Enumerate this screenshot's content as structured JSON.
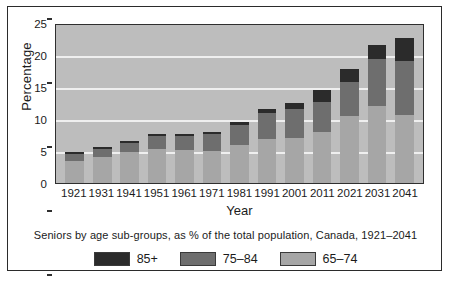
{
  "chart_data": {
    "type": "bar",
    "stacked": true,
    "title": "",
    "caption": "Seniors by age sub-groups, as % of the total population, Canada, 1921–2041",
    "xlabel": "Year",
    "ylabel": "Percentage",
    "ylim": [
      0,
      25
    ],
    "yticks": [
      0,
      5,
      10,
      15,
      20,
      25
    ],
    "grid": true,
    "legend_position": "bottom",
    "categories": [
      "1921",
      "1931",
      "1941",
      "1951",
      "1961",
      "1971",
      "1981",
      "1991",
      "2001",
      "2011",
      "2021",
      "2031",
      "2041"
    ],
    "series": [
      {
        "name": "65–74",
        "color": "#a6a6a6",
        "values": [
          3.4,
          4.0,
          4.8,
          5.3,
          5.2,
          5.0,
          6.0,
          6.9,
          7.1,
          8.0,
          10.5,
          12.0,
          10.6
        ]
      },
      {
        "name": "75–84",
        "color": "#6e6e6e",
        "values": [
          1.1,
          1.3,
          1.5,
          2.0,
          2.2,
          2.7,
          3.1,
          4.0,
          4.5,
          4.7,
          5.3,
          7.4,
          8.4
        ]
      },
      {
        "name": "85+",
        "color": "#2b2b2b",
        "values": [
          0.3,
          0.3,
          0.3,
          0.3,
          0.3,
          0.3,
          0.5,
          0.7,
          0.9,
          1.8,
          2.0,
          2.2,
          3.6
        ]
      }
    ],
    "totals": [
      4.8,
      5.6,
      6.6,
      7.6,
      7.7,
      8.0,
      9.6,
      11.6,
      12.5,
      14.5,
      17.8,
      21.6,
      22.6
    ],
    "legend": [
      {
        "label": "85+",
        "color": "#2b2b2b"
      },
      {
        "label": "75–84",
        "color": "#6e6e6e"
      },
      {
        "label": "65–74",
        "color": "#a6a6a6"
      }
    ],
    "colors": {
      "plot_background": "#bdbdbd",
      "gridline": "#efefef",
      "axis": "#2f2f2f",
      "text": "#1b1b1b",
      "figure_border": "#2b2b2b"
    }
  }
}
